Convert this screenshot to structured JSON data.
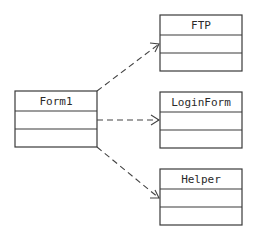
{
  "diagram": {
    "type": "uml-class-dependency",
    "classes": [
      {
        "id": "form1",
        "name": "Form1",
        "x": 15,
        "y": 91,
        "w": 82,
        "rows": [
          20,
          18,
          18
        ]
      },
      {
        "id": "ftp",
        "name": "FTP",
        "x": 160,
        "y": 15,
        "w": 82,
        "rows": [
          20,
          18,
          18
        ]
      },
      {
        "id": "loginform",
        "name": "LoginForm",
        "x": 160,
        "y": 92,
        "w": 82,
        "rows": [
          20,
          18,
          18
        ]
      },
      {
        "id": "helper",
        "name": "Helper",
        "x": 160,
        "y": 169,
        "w": 82,
        "rows": [
          20,
          18,
          18
        ]
      }
    ],
    "dependencies": [
      {
        "from": "Form1",
        "to": "FTP",
        "style": "dashed",
        "arrow": "open"
      },
      {
        "from": "Form1",
        "to": "LoginForm",
        "style": "dashed",
        "arrow": "open"
      },
      {
        "from": "Form1",
        "to": "Helper",
        "style": "dashed",
        "arrow": "open"
      }
    ],
    "colors": {
      "stroke": "#3a3a3a",
      "background": "#ffffff"
    }
  }
}
